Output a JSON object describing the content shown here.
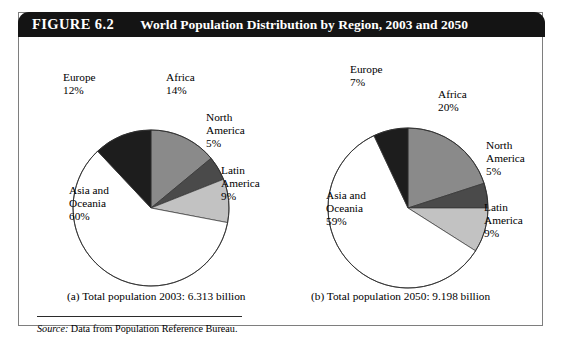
{
  "figure": {
    "number": "FIGURE 6.2",
    "title": "World Population Distribution by Region, 2003 and 2050",
    "header_bg": "#141414",
    "header_text_color": "#ffffff",
    "panel_border": "#7e7e7e"
  },
  "captions": {
    "a": "(a) Total population 2003: 6.313 billion",
    "b": "(b) Total population 2050: 9.198 billion"
  },
  "source": {
    "label": "Source:",
    "text": " Data from Population Reference Bureau."
  },
  "labels": {
    "a": {
      "europe": "Europe\n12%",
      "africa": "Africa\n14%",
      "north_america": "North\nAmerica\n5%",
      "latin_america": "Latin\nAmerica\n9%",
      "asia": "Asia and\nOceania\n60%"
    },
    "b": {
      "europe": "Europe\n7%",
      "africa": "Africa\n20%",
      "north_america": "North\nAmerica\n5%",
      "latin_america": "Latin\nAmerica\n9%",
      "asia": "Asia and\nOceania\n59%"
    }
  },
  "chart_data": [
    {
      "type": "pie",
      "id": "a",
      "title": "(a) Total population 2003: 6.313 billion",
      "total_population_billion": 6.313,
      "year": 2003,
      "start_angle_deg": 0,
      "direction": "clockwise",
      "categories": [
        "Africa",
        "North America",
        "Latin America",
        "Asia and Oceania",
        "Europe"
      ],
      "values": [
        14,
        5,
        9,
        60,
        12
      ],
      "unit": "percent",
      "colors": [
        "#8a8a8a",
        "#4a4a4a",
        "#c2c2c2",
        "#ffffff",
        "#1d1d1d"
      ],
      "legend": "none",
      "center": [
        100,
        130
      ],
      "radius": 78
    },
    {
      "type": "pie",
      "id": "b",
      "title": "(b) Total population 2050: 9.198 billion",
      "total_population_billion": 9.198,
      "year": 2050,
      "start_angle_deg": 0,
      "direction": "clockwise",
      "categories": [
        "Africa",
        "North America",
        "Latin America",
        "Asia and Oceania",
        "Europe"
      ],
      "values": [
        20,
        5,
        9,
        59,
        7
      ],
      "unit": "percent",
      "colors": [
        "#8a8a8a",
        "#4a4a4a",
        "#c2c2c2",
        "#ffffff",
        "#1d1d1d"
      ],
      "legend": "none",
      "center": [
        100,
        131
      ],
      "radius": 80
    }
  ]
}
